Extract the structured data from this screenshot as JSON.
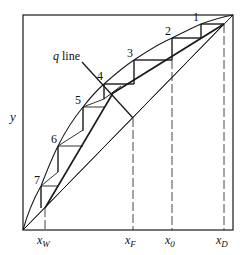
{
  "axis": {
    "y_label": "y",
    "x_ticks": [
      {
        "label": "x",
        "sub": "W"
      },
      {
        "label": "x",
        "sub": "F"
      },
      {
        "label": "x",
        "sub": "0"
      },
      {
        "label": "x",
        "sub": "D"
      }
    ]
  },
  "annotations": {
    "q_line_label_q": "q",
    "q_line_label_rest": " line"
  },
  "stages": [
    "1",
    "2",
    "3",
    "4",
    "5",
    "6",
    "7"
  ],
  "colors": {
    "line": "#1a1a1a",
    "background": "#ffffff"
  }
}
